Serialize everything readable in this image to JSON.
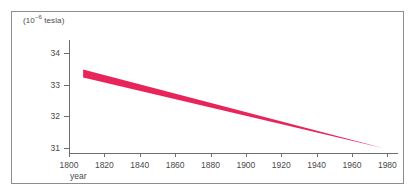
{
  "figure": {
    "background_color": "#ffffff",
    "frame_border_color": "#8d8d8d",
    "axis_color": "#6f6f6f",
    "band_color": "#E8255A"
  },
  "chart_data": {
    "type": "area",
    "title": "",
    "subtitle": "",
    "unit_label_prefix": "(10",
    "unit_label_exponent": "−6",
    "unit_label_suffix": " tesla)",
    "ylabel": "(10⁻⁶ tesla)",
    "xlabel": "year",
    "xlim": [
      1800,
      1986
    ],
    "ylim": [
      30.85,
      34.4
    ],
    "xticks": [
      1800,
      1820,
      1840,
      1860,
      1880,
      1900,
      1920,
      1940,
      1960,
      1980
    ],
    "xticklabels": [
      "1800",
      "1820",
      "1840",
      "1860",
      "1880",
      "1900",
      "1920",
      "1940",
      "1960",
      "1980"
    ],
    "yticks": [
      31,
      32,
      33,
      34
    ],
    "yticklabels": [
      "31",
      "32",
      "33",
      "34"
    ],
    "grid": false,
    "legend": false,
    "series": [
      {
        "name": "geomagnetic field strength (uncertainty band)",
        "color": "#E8255A",
        "x": [
          1808,
          1978
        ],
        "upper": [
          33.47,
          31.0
        ],
        "lower": [
          33.22,
          31.0
        ]
      }
    ],
    "annotations": []
  }
}
